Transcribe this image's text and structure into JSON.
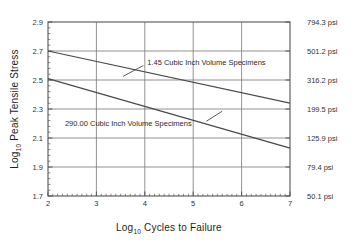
{
  "chart_data": {
    "type": "line",
    "title": "",
    "xlabel": "Log10 Cycles to Failure",
    "xlabel_base": "Log",
    "xlabel_sub": "10",
    "xlabel_rest": " Cycles to Failure",
    "ylabel": "Log10 Peak Tensile Stress",
    "ylabel_base": "Log",
    "ylabel_sub": "10",
    "ylabel_rest": " Peak Tensile Stress",
    "xlim": [
      2,
      7
    ],
    "ylim": [
      1.7,
      2.9
    ],
    "grid": true,
    "legend_position": "inline-annotations",
    "xticks": [
      2,
      3,
      4,
      5,
      6,
      7
    ],
    "xtick_labels": [
      "2",
      "3",
      "4",
      "5",
      "6",
      "7"
    ],
    "x_minor_ticks_per_interval": 10,
    "yticks": [
      1.7,
      1.9,
      2.1,
      2.3,
      2.5,
      2.7,
      2.9
    ],
    "ytick_labels": [
      "1.7",
      "1.9",
      "2.1",
      "2.3",
      "2.5",
      "2.7",
      "2.9"
    ],
    "y_minor_ticks_per_interval": 5,
    "right_axis": {
      "label": "psi",
      "ticks": [
        1.7,
        1.9,
        2.1,
        2.3,
        2.5,
        2.7,
        2.9
      ],
      "tick_labels": [
        "50.1 psi",
        "79.4 psi",
        "125.9 psi",
        "199.5 psi",
        "316.2 psi",
        "501.2 psi",
        "794.3 psi"
      ]
    },
    "series": [
      {
        "name": "1.45 Cubic Inch Volume Specimens",
        "x": [
          2,
          7
        ],
        "values": [
          2.7,
          2.34
        ],
        "color": "#4a4a4a"
      },
      {
        "name": "290.00 Cubic Inch Volume Specimens",
        "x": [
          2,
          7
        ],
        "values": [
          2.51,
          2.03
        ],
        "color": "#4a4a4a"
      }
    ],
    "annotations": [
      {
        "text": "1.45 Cubic Inch Volume Specimens",
        "text_x": 4.05,
        "text_y": 2.625,
        "leader_from_x": 3.97,
        "leader_from_y": 2.6,
        "leader_to_x": 3.55,
        "leader_to_y": 2.525
      },
      {
        "text": "290.00 Cubic Inch Volume Specimens",
        "text_x": 2.35,
        "text_y": 2.205,
        "leader_from_x": 5.27,
        "leader_from_y": 2.215,
        "leader_to_x": 5.6,
        "leader_to_y": 2.285
      }
    ],
    "colors": {
      "axis": "#555555",
      "gridline": "#777777",
      "series": "#4a4a4a",
      "text": "#2a2a2a",
      "background": "#ffffff"
    }
  }
}
